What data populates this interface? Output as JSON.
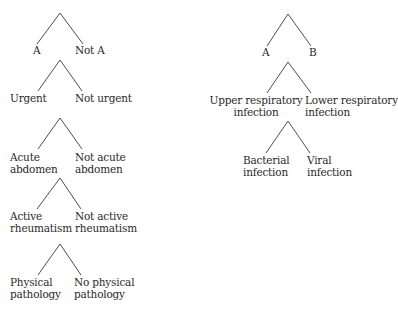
{
  "diagram": {
    "left_column": {
      "splits": [
        {
          "id": "a-not-a",
          "left": [
            "A"
          ],
          "right": [
            "Not A"
          ]
        },
        {
          "id": "urgent",
          "left": [
            "Urgent"
          ],
          "right": [
            "Not urgent"
          ]
        },
        {
          "id": "acute-abdomen",
          "left": [
            "Acute",
            "abdomen"
          ],
          "right": [
            "Not acute",
            "abdomen"
          ]
        },
        {
          "id": "active-rheumatism",
          "left": [
            "Active",
            "rheumatism"
          ],
          "right": [
            "Not active",
            "rheumatism"
          ]
        },
        {
          "id": "physical-pathology",
          "left": [
            "Physical",
            "pathology"
          ],
          "right": [
            "No physical",
            "pathology"
          ]
        }
      ]
    },
    "right_column": {
      "splits": [
        {
          "id": "a-b",
          "left": [
            "A"
          ],
          "right": [
            "B"
          ]
        },
        {
          "id": "respiratory",
          "left": [
            "Upper respiratory",
            "infection"
          ],
          "right": [
            "Lower respiratory",
            "infection"
          ]
        },
        {
          "id": "infection-type",
          "left": [
            "Bacterial",
            "infection"
          ],
          "right": [
            "Viral",
            "infection"
          ]
        }
      ]
    },
    "colors": {
      "line": "#3a3a3a",
      "text": "#2a2a2a",
      "background": "#ffffff"
    }
  }
}
